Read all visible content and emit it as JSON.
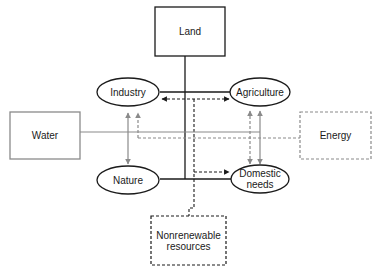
{
  "diagram": {
    "nodes": {
      "land": {
        "label": "Land",
        "shape": "box",
        "style": "solid-black"
      },
      "water": {
        "label": "Water",
        "shape": "box",
        "style": "solid-gray"
      },
      "energy": {
        "label": "Energy",
        "shape": "box",
        "style": "dashed-gray"
      },
      "nonrenewable": {
        "label_line1": "Nonrenewable",
        "label_line2": "resources",
        "shape": "box",
        "style": "dashed-black"
      },
      "industry": {
        "label": "Industry",
        "shape": "ellipse"
      },
      "agriculture": {
        "label": "Agriculture",
        "shape": "ellipse"
      },
      "nature": {
        "label": "Nature",
        "shape": "ellipse"
      },
      "domestic": {
        "label_line1": "Domestic",
        "label_line2": "needs",
        "shape": "ellipse"
      }
    },
    "edges": [
      {
        "from": "land",
        "to": "industry-agriculture-nature-domestic",
        "style": "solid-black"
      },
      {
        "from": "water",
        "to": "industry-nature-agriculture-domestic",
        "style": "solid-gray",
        "arrows": "bidirectional"
      },
      {
        "from": "energy",
        "to": "industry-agriculture-domestic",
        "style": "dashed-gray",
        "arrows": "bidirectional"
      },
      {
        "from": "nonrenewable",
        "to": "industry-agriculture-domestic",
        "style": "dashed-black",
        "arrows": "bidirectional"
      }
    ],
    "colors": {
      "black": "#1a1a1a",
      "gray": "#8a8a8a"
    }
  }
}
